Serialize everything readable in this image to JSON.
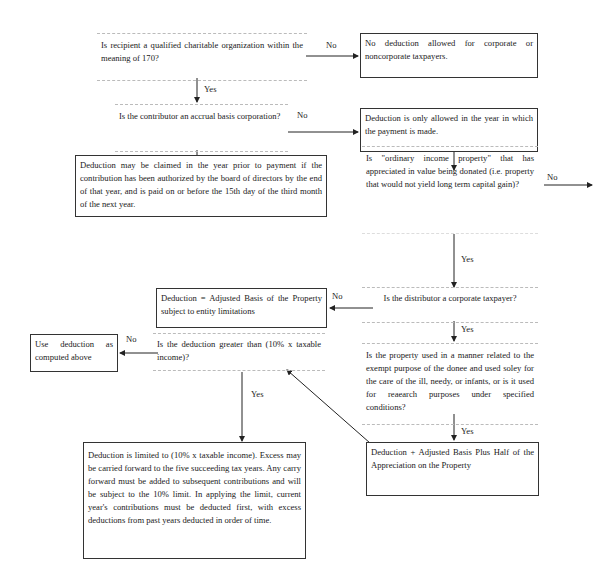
{
  "flowchart": {
    "nodes": {
      "q_qualified_org": "Is recipient a qualified charitable organization within the meaning of 170?",
      "r_no_deduction": "No deduction allowed for corporate or noncorporate taxpayers.",
      "q_accrual_basis": "Is the contributor an accrual basis corporation?",
      "r_only_year_paid": "Deduction is only allowed in the year in which the payment is made.",
      "r_prior_year": "Deduction may be claimed in the year prior to payment if the contribution has been authorized by the board of directors by the end of that year, and is paid on or before the 15th day of the third month of the next year.",
      "q_ordinary_income": "Is \"ordinary income property\" that has appreciated in value being donated (i.e. property that would not yield long term capital gain)?",
      "q_corporate_taxpayer": "Is the distributor a corporate taxpayer?",
      "r_adjusted_basis": "Deduction = Adjusted Basis of the Property subject to entity limitations",
      "q_property_use": "Is the property used in a manner related to the exempt purpose of the donee and used soley for the care of the ill, needy, or infants, or is it used for reaearch purposes under specified conditions?",
      "r_basis_plus_half": "Deduction + Adjusted Basis Plus Half of the Appreciation on the Property",
      "q_greater_than_10": "Is the deduction greater than (10% x taxable income)?",
      "r_use_computed": "Use deduction as computed above",
      "r_limited_10": "Deduction is limited to (10% x taxable income). Excess may be carried forward to the five succeeding tax years. Any carry forward must be added to subsequent contributions and will be subject to the 10% limit. In applying the limit, current year's contributions must be deducted first, with excess deductions from past years deducted in order of time."
    },
    "edge_labels": {
      "q1_no": "No",
      "q1_yes": "Yes",
      "q2_no": "No",
      "q2_yes": "Yes",
      "q3_no": "No",
      "q3_yes": "Yes",
      "q4_no": "No",
      "q4_yes": "Yes",
      "q5_yes": "Yes",
      "q6_no": "No",
      "q6_yes": "Yes"
    }
  }
}
